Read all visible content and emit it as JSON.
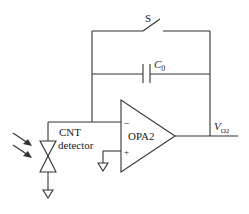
{
  "diagram": {
    "type": "circuit-schematic",
    "components": {
      "switch": {
        "label": "S"
      },
      "capacitor": {
        "label_main": "C",
        "label_sub": "0"
      },
      "opamp": {
        "label": "OPA2",
        "inverting_input": "−",
        "noninverting_input": "+"
      },
      "detector": {
        "label_line1": "CNT",
        "label_line2": "detector"
      },
      "output": {
        "label_main": "V",
        "label_sub": "O2"
      }
    },
    "colors": {
      "stroke": "#333333",
      "background": "#ffffff"
    }
  }
}
